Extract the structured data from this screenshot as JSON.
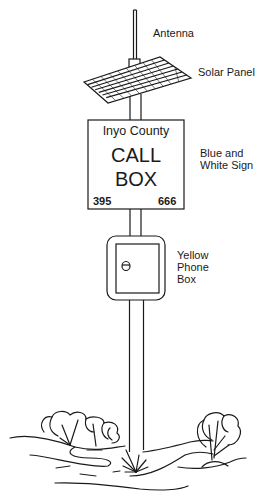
{
  "diagram": {
    "labels": {
      "antenna": "Antenna",
      "solar_panel": "Solar Panel",
      "sign_line1": "Blue and",
      "sign_line2": "White Sign",
      "phone_box_line1": "Yellow",
      "phone_box_line2": "Phone",
      "phone_box_line3": "Box"
    },
    "sign": {
      "county": "Inyo County",
      "line1": "CALL",
      "line2": "BOX",
      "route": "395",
      "number": "666"
    },
    "components": [
      "antenna",
      "solar-panel",
      "sign",
      "phone-box",
      "pole",
      "ground-shrubs"
    ],
    "colors": {
      "line": "#1a1a1a",
      "background": "#ffffff"
    }
  }
}
